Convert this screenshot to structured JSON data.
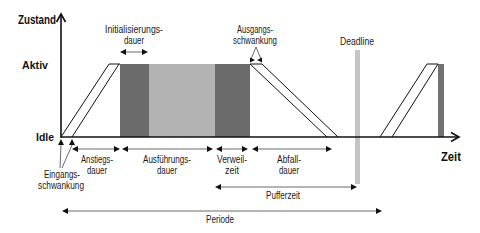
{
  "diagram": {
    "axes": {
      "y_title": "Zustand",
      "x_title": "Zeit",
      "y_levels": {
        "high": "Aktiv",
        "low": "Idle"
      }
    },
    "phases": [
      {
        "id": "anstieg",
        "line1": "Anstiegs-",
        "line2": "dauer"
      },
      {
        "id": "ausfuehrung",
        "line1": "Ausführungs-",
        "line2": "dauer"
      },
      {
        "id": "verweil",
        "line1": "Verweil-",
        "line2": "zeit"
      },
      {
        "id": "abfall",
        "line1": "Abfall-",
        "line2": "dauer"
      }
    ],
    "annotations": {
      "initialisierung": {
        "line1": "Initialisierungs-",
        "line2": "dauer"
      },
      "ausgangsschwankung": {
        "line1": "Ausgangs-",
        "line2": "schwankung"
      },
      "eingangsschwankung": {
        "line1": "Eingangs-",
        "line2": "schwankung"
      },
      "deadline": "Deadline",
      "pufferzeit": "Pufferzeit",
      "periode": "Periode"
    },
    "colors": {
      "init_block": "#6b6b6b",
      "exec_block": "#b3b3b3",
      "dwell_block": "#6b6b6b",
      "deadline_bar": "#c4c4c4",
      "next_period_block": "#727272"
    }
  }
}
